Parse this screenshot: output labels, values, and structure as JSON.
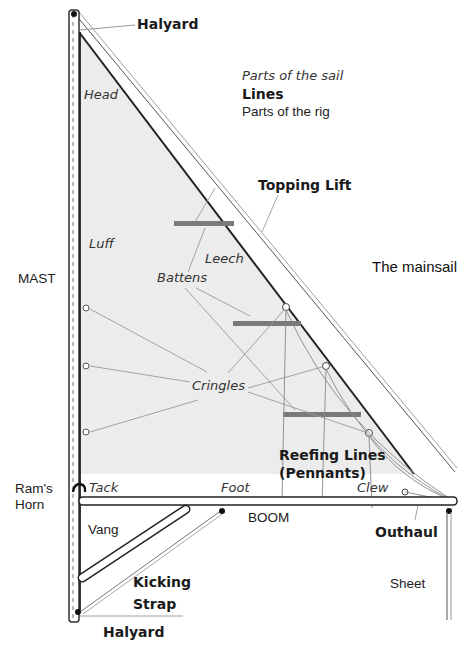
{
  "diagram": {
    "title": "The mainsail",
    "legend": {
      "sail_parts": "Parts of the sail",
      "lines": "Lines",
      "rig_parts": "Parts of the rig"
    },
    "sail_parts": {
      "head": "Head",
      "luff": "Luff",
      "leech": "Leech",
      "battens": "Battens",
      "cringles": "Cringles",
      "tack": "Tack",
      "foot": "Foot",
      "clew": "Clew"
    },
    "lines": {
      "halyard_top": "Halyard",
      "topping_lift": "Topping Lift",
      "reefing_lines_1": "Reefing Lines",
      "reefing_lines_2": "(Pennants)",
      "outhaul": "Outhaul",
      "kicking_strap_1": "Kicking",
      "kicking_strap_2": "Strap",
      "halyard_bottom": "Halyard"
    },
    "rig_parts": {
      "mast": "MAST",
      "rams_horn_1": "Ram's",
      "rams_horn_2": "Horn",
      "boom": "BOOM",
      "vang": "Vang",
      "sheet": "Sheet"
    },
    "colors": {
      "sail_fill": "#ececec",
      "outline": "#222222",
      "batten": "#7a7a7a",
      "leader": "#9a9a9a"
    }
  }
}
